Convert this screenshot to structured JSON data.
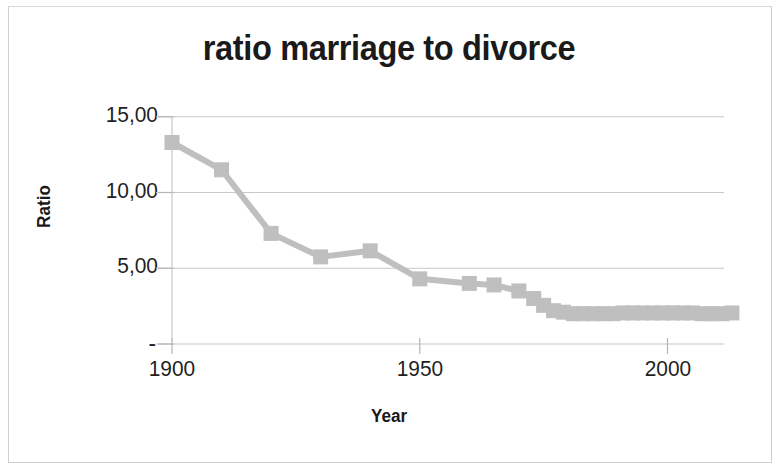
{
  "figure": {
    "title": "ratio marriage to divorce",
    "x_axis_title": "Year",
    "y_axis_title": "Ratio",
    "marker_color": "#bfbfbf",
    "line_color": "#bfbfbf",
    "gridline_color": "#c8c8c8",
    "text_color": "#1a1a1a",
    "background": "#ffffff"
  },
  "chart_data": {
    "type": "line",
    "title": "ratio marriage to divorce",
    "xlabel": "Year",
    "ylabel": "Ratio",
    "xlim": [
      1895,
      2015
    ],
    "ylim": [
      0,
      15
    ],
    "grid": true,
    "legend": "none",
    "marker": "square",
    "x_ticks": [
      1900,
      1950,
      2000
    ],
    "x_tick_labels": [
      "1900",
      "1950",
      "2000"
    ],
    "y_ticks": [
      0,
      5,
      10,
      15
    ],
    "y_tick_labels": [
      "-",
      "5,00",
      "10,00",
      "15,00"
    ],
    "series": [
      {
        "name": "ratio marriage to divorce",
        "x": [
          1900,
          1910,
          1920,
          1930,
          1940,
          1950,
          1960,
          1965,
          1970,
          1973,
          1975,
          1977,
          1979,
          1981,
          1983,
          1985,
          1987,
          1989,
          1991,
          1993,
          1995,
          1997,
          1999,
          2001,
          2003,
          2005,
          2007,
          2009,
          2011,
          2013
        ],
        "values": [
          13.3,
          11.5,
          7.3,
          5.75,
          6.15,
          4.3,
          4.0,
          3.9,
          3.5,
          3.0,
          2.55,
          2.2,
          2.1,
          2.0,
          2.0,
          2.0,
          2.0,
          2.0,
          2.05,
          2.05,
          2.05,
          2.05,
          2.05,
          2.05,
          2.05,
          2.05,
          2.0,
          2.0,
          2.0,
          2.05
        ]
      }
    ]
  }
}
